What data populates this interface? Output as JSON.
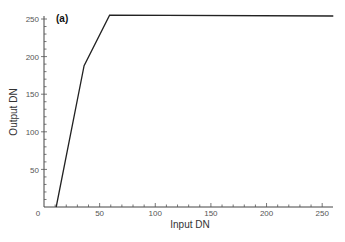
{
  "chart_data": {
    "type": "line",
    "title": "",
    "panel_label": "(a)",
    "xlabel": "Input DN",
    "ylabel": "Output DN",
    "xlim": [
      0,
      260
    ],
    "ylim": [
      0,
      260
    ],
    "x_ticks": [
      0,
      50,
      100,
      150,
      200,
      250
    ],
    "y_ticks": [
      50,
      100,
      150,
      200,
      250
    ],
    "grid": false,
    "legend": null,
    "series": [
      {
        "name": "stretch function",
        "color": "#222222",
        "points": [
          [
            11,
            0
          ],
          [
            36,
            188
          ],
          [
            59,
            255
          ],
          [
            260,
            254
          ]
        ]
      }
    ]
  },
  "labels": {
    "panel": "(a)",
    "xlabel": "Input DN",
    "ylabel": "Output DN",
    "x0": "0",
    "x50": "50",
    "x100": "100",
    "x150": "150",
    "x200": "200",
    "x250": "250",
    "y50": "50",
    "y100": "100",
    "y150": "150",
    "y200": "200",
    "y250": "250"
  }
}
